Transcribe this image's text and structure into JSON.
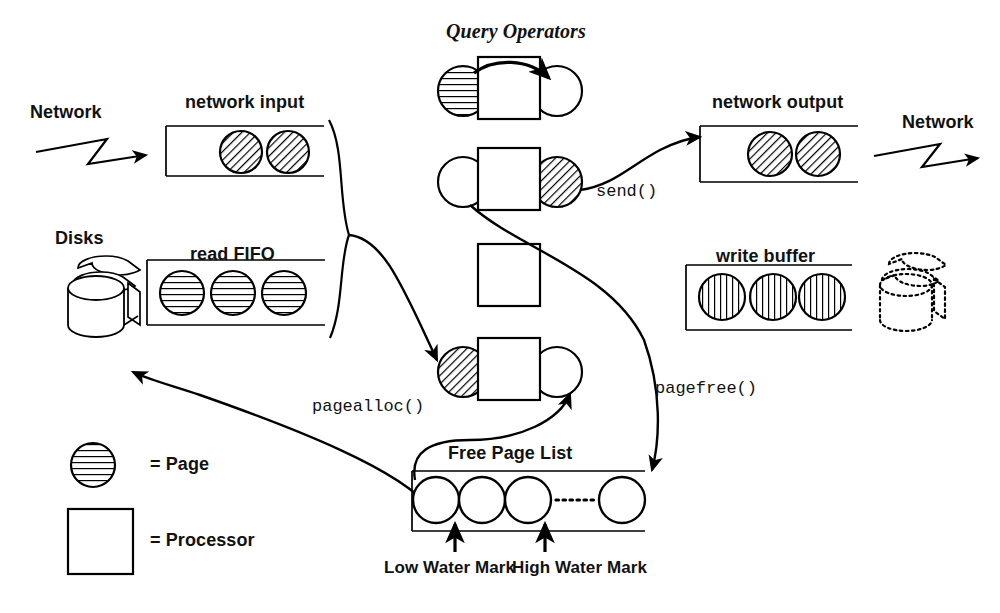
{
  "diagram": {
    "title": "Query Operators",
    "labels": {
      "network_left": "Network",
      "network_right": "Network",
      "network_input": "network input",
      "network_output": "network output",
      "disks": "Disks",
      "read_fifo": "read FIFO",
      "write_buffer": "write buffer",
      "free_page_list": "Free Page List",
      "low_water_mark": "Low Water Mark",
      "high_water_mark": "High Water Mark"
    },
    "calls": {
      "send": "send()",
      "pagealloc": "pagealloc()",
      "pagefree": "pagefree()"
    },
    "legend": [
      {
        "symbol": "hatched-circle-horizontal",
        "equals": "= Page"
      },
      {
        "symbol": "empty-square",
        "equals": "= Processor"
      }
    ],
    "buffers": [
      {
        "name": "network input",
        "pages": [
          "diagonal",
          "diagonal"
        ]
      },
      {
        "name": "read FIFO",
        "pages": [
          "horizontal",
          "horizontal",
          "horizontal"
        ]
      },
      {
        "name": "network output",
        "pages": [
          "diagonal",
          "diagonal"
        ]
      },
      {
        "name": "write buffer",
        "pages": [
          "vertical",
          "vertical",
          "vertical"
        ]
      },
      {
        "name": "Free Page List",
        "pages": [
          "empty",
          "empty",
          "empty",
          "ellipsis",
          "empty"
        ]
      }
    ],
    "processors": [
      {
        "index": 1,
        "left_circle": "horizontal",
        "right_circle": "empty",
        "has_top_arrow": true
      },
      {
        "index": 2,
        "left_circle": "empty",
        "right_circle": "diagonal",
        "has_top_arrow": false
      },
      {
        "index": 3,
        "left_circle": "none",
        "right_circle": "none",
        "has_top_arrow": false
      },
      {
        "index": 4,
        "left_circle": "diagonal",
        "right_circle": "empty",
        "has_top_arrow": false
      }
    ],
    "colors": {
      "stroke": "#000000",
      "background": "#ffffff",
      "hatch": "#000000"
    }
  }
}
